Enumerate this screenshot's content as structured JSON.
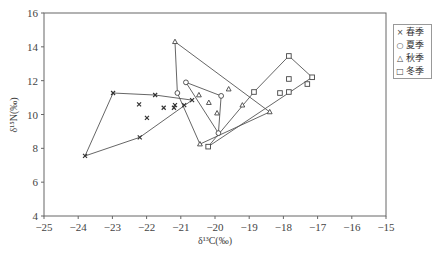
{
  "chart_data": {
    "type": "scatter",
    "title": "",
    "xlabel": "δ13C(‰)",
    "ylabel": "δ15N(‰)",
    "xlim": [
      -25,
      -15
    ],
    "ylim": [
      4,
      16
    ],
    "xticks": [
      -25,
      -24,
      -23,
      -22,
      -21,
      -20,
      -19,
      -18,
      -17,
      -16,
      -15
    ],
    "yticks": [
      4,
      6,
      8,
      10,
      12,
      14,
      16
    ],
    "grid": false,
    "legend_position": "right",
    "series": [
      {
        "name": "春季",
        "marker": "x",
        "points": [
          [
            -22.98,
            11.27
          ],
          [
            -21.75,
            11.15
          ],
          [
            -22.22,
            10.6
          ],
          [
            -21.99,
            9.8
          ],
          [
            -21.5,
            10.4
          ],
          [
            -21.2,
            10.4
          ],
          [
            -21.17,
            10.55
          ],
          [
            -20.9,
            10.55
          ],
          [
            -20.67,
            10.85
          ],
          [
            -22.2,
            8.65
          ],
          [
            -23.8,
            7.55
          ]
        ],
        "hull": [
          [
            -23.8,
            7.55
          ],
          [
            -22.98,
            11.27
          ],
          [
            -21.75,
            11.15
          ],
          [
            -20.67,
            10.85
          ],
          [
            -22.2,
            8.65
          ]
        ]
      },
      {
        "name": "夏季",
        "marker": "circle",
        "points": [
          [
            -20.85,
            11.9
          ],
          [
            -19.82,
            11.1
          ],
          [
            -19.9,
            8.9
          ],
          [
            -21.1,
            11.27
          ]
        ],
        "hull": [
          [
            -20.85,
            11.9
          ],
          [
            -19.82,
            11.1
          ],
          [
            -19.9,
            8.9
          ]
        ]
      },
      {
        "name": "秋季",
        "marker": "triangle",
        "points": [
          [
            -21.17,
            14.3
          ],
          [
            -19.6,
            11.5
          ],
          [
            -18.4,
            10.15
          ],
          [
            -20.47,
            11.15
          ],
          [
            -20.18,
            10.7
          ],
          [
            -19.94,
            10.08
          ],
          [
            -20.44,
            8.25
          ],
          [
            -19.2,
            10.55
          ]
        ],
        "hull": [
          [
            -21.17,
            14.3
          ],
          [
            -18.4,
            10.15
          ],
          [
            -20.44,
            8.25
          ],
          [
            -21.1,
            11.27
          ]
        ]
      },
      {
        "name": "冬季",
        "marker": "square",
        "points": [
          [
            -17.84,
            13.46
          ],
          [
            -17.16,
            12.2
          ],
          [
            -17.3,
            11.8
          ],
          [
            -17.84,
            12.1
          ],
          [
            -17.84,
            11.33
          ],
          [
            -18.1,
            11.27
          ],
          [
            -18.86,
            11.33
          ],
          [
            -20.2,
            8.1
          ]
        ],
        "hull": [
          [
            -20.2,
            8.1
          ],
          [
            -18.86,
            11.33
          ],
          [
            -17.84,
            13.46
          ],
          [
            -17.16,
            12.2
          ]
        ]
      }
    ]
  },
  "legend": {
    "items": [
      {
        "label": "春季",
        "glyph": "×"
      },
      {
        "label": "夏季",
        "glyph": "○"
      },
      {
        "label": "秋季",
        "glyph": "△"
      },
      {
        "label": "冬季",
        "glyph": "□"
      }
    ]
  },
  "axes": {
    "xlabel": "δ¹³C(‰)",
    "ylabel": "δ¹⁵N(‰)"
  }
}
